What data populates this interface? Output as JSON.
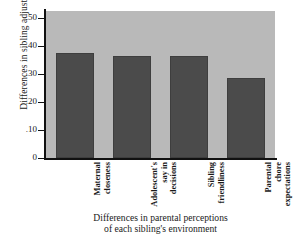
{
  "chart_data": {
    "type": "bar",
    "title": "",
    "xlabel": "Differences in parental perceptions of each sibling's environment",
    "xlabel_lines": [
      "Differences in parental perceptions",
      "of each sibling's environment"
    ],
    "ylabel": "Differences in sibling adjustment",
    "ylim": [
      0,
      0.5
    ],
    "grid": false,
    "legend": "none",
    "plot_background": "#b9b9b9",
    "bar_color": "#4b4b4b",
    "ytick_labels": [
      ".50",
      ".40",
      ".30",
      ".20",
      ".10",
      "0"
    ],
    "ytick_values": [
      0.5,
      0.4,
      0.3,
      0.2,
      0.1,
      0
    ],
    "categories": [
      "Maternal closeness",
      "Adolescent's say in decisions",
      "Sibling friendliness",
      "Parental chore expectations"
    ],
    "category_lines": [
      [
        "Maternal",
        "closeness"
      ],
      [
        "Adolescent's",
        "say in",
        "decisions"
      ],
      [
        "Sibling",
        "friendliness"
      ],
      [
        "Parental",
        "chore",
        "expectations"
      ]
    ],
    "values": [
      0.375,
      0.363,
      0.362,
      0.285
    ]
  }
}
